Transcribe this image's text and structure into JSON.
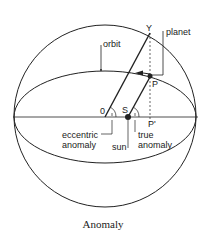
{
  "diagram": {
    "caption": "Anomaly",
    "labels": {
      "orbit": "orbit",
      "planet": "planet",
      "y_point": "Y",
      "p_point": "P",
      "p_prime": "P'",
      "o_point": "0",
      "s_point": "S",
      "eccentric_anomaly_1": "eccentric",
      "eccentric_anomaly_2": "anomaly",
      "true_anomaly_1": "true",
      "true_anomaly_2": "anomaly",
      "sun": "sun"
    },
    "colors": {
      "stroke": "#222222",
      "background": "#ffffff"
    }
  }
}
